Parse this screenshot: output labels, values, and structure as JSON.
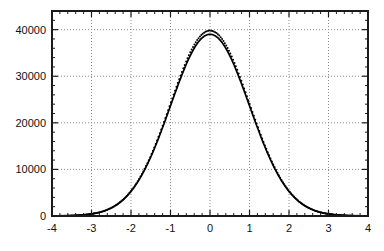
{
  "chart_data": {
    "type": "line",
    "title": "",
    "subtitle": "",
    "xlabel": "",
    "ylabel": "",
    "xlim": [
      -4,
      4
    ],
    "ylim": [
      0,
      44000
    ],
    "grid": true,
    "grid_style": "dotted",
    "legend": null,
    "legend_position": "none",
    "x_ticks": [
      -4,
      -3,
      -2,
      -1,
      0,
      1,
      2,
      3,
      4
    ],
    "x_tick_labels": [
      "-4",
      "-3",
      "-2",
      "-1",
      "0",
      "1",
      "2",
      "3",
      "4"
    ],
    "x_minor_tick_step": 0.2,
    "y_ticks": [
      0,
      10000,
      20000,
      30000,
      40000
    ],
    "y_tick_labels": [
      "0",
      "10000",
      "20000",
      "30000",
      "40000"
    ],
    "y_minor_tick_step": 2000,
    "series": [
      {
        "name": "fitted-gaussian",
        "style": "solid-line",
        "color": "#000000",
        "peak_value": 39000,
        "mean": 0.0,
        "sigma": 1.0,
        "amplitude": 39000,
        "x": [
          -4.0,
          -3.8,
          -3.6,
          -3.4,
          -3.2,
          -3.0,
          -2.8,
          -2.6,
          -2.4,
          -2.2,
          -2.0,
          -1.8,
          -1.6,
          -1.4,
          -1.2,
          -1.0,
          -0.8,
          -0.6,
          -0.4,
          -0.2,
          0.0,
          0.2,
          0.4,
          0.6,
          0.8,
          1.0,
          1.2,
          1.4,
          1.6,
          1.8,
          2.0,
          2.2,
          2.4,
          2.6,
          2.8,
          3.0,
          3.2,
          3.4,
          3.6,
          3.8,
          4.0
        ],
        "values": [
          13,
          30,
          64,
          132,
          261,
          497,
          911,
          1608,
          2733,
          4473,
          7053,
          10720,
          15687,
          22090,
          29977,
          39000,
          28422,
          32615,
          36041,
          38226,
          39000,
          38226,
          36041,
          32615,
          28422,
          23661,
          18975,
          14629,
          10861,
          7777,
          5278,
          3403,
          2078,
          1196,
          640,
          321,
          152,
          67,
          28,
          11,
          4
        ]
      },
      {
        "name": "data-points",
        "style": "dotted-markers",
        "color": "#000000",
        "peak_value": 39800,
        "mean": 0.0,
        "sigma": 1.0,
        "amplitude": 39800,
        "x": [
          -4.0,
          -3.8,
          -3.6,
          -3.4,
          -3.2,
          -3.0,
          -2.8,
          -2.6,
          -2.4,
          -2.2,
          -2.0,
          -1.8,
          -1.6,
          -1.4,
          -1.2,
          -1.0,
          -0.8,
          -0.6,
          -0.4,
          -0.2,
          0.0,
          0.2,
          0.4,
          0.6,
          0.8,
          1.0,
          1.2,
          1.4,
          1.6,
          1.8,
          2.0,
          2.2,
          2.4,
          2.6,
          2.8,
          3.0,
          3.2,
          3.4,
          3.6,
          3.8,
          4.0
        ],
        "values": [
          13,
          31,
          66,
          135,
          267,
          507,
          930,
          1641,
          2789,
          4565,
          7198,
          10940,
          16009,
          22543,
          30592,
          39800,
          29007,
          33284,
          36780,
          39010,
          39800,
          39010,
          36780,
          33284,
          29007,
          24146,
          19364,
          14929,
          11084,
          7937,
          5386,
          3473,
          2120,
          1220,
          653,
          327,
          155,
          68,
          29,
          11,
          4
        ]
      }
    ]
  },
  "axes": {
    "frame_color": "#1a1a1a",
    "grid_color": "#8c8c8c",
    "background": "#ffffff"
  }
}
